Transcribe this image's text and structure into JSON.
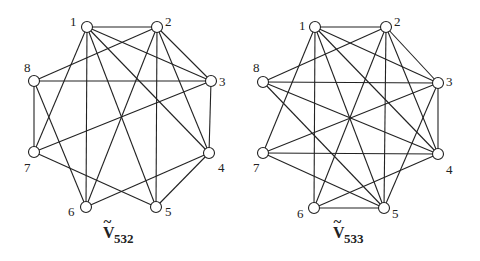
{
  "graphs": [
    {
      "name": "V532",
      "label": {
        "main": "V",
        "accent": "~",
        "subscript": "532",
        "x": 103,
        "y": 238
      },
      "nodes": [
        {
          "id": "1",
          "x": 87,
          "y": 27,
          "lx": 70,
          "ly": 26
        },
        {
          "id": "2",
          "x": 157,
          "y": 27,
          "lx": 165,
          "ly": 26
        },
        {
          "id": "3",
          "x": 211,
          "y": 81,
          "lx": 219,
          "ly": 86
        },
        {
          "id": "4",
          "x": 209,
          "y": 153,
          "lx": 218,
          "ly": 172
        },
        {
          "id": "5",
          "x": 156,
          "y": 207,
          "lx": 165,
          "ly": 216
        },
        {
          "id": "6",
          "x": 86,
          "y": 207,
          "lx": 68,
          "ly": 216
        },
        {
          "id": "7",
          "x": 34,
          "y": 152,
          "lx": 24,
          "ly": 172
        },
        {
          "id": "8",
          "x": 34,
          "y": 81,
          "lx": 24,
          "ly": 72
        }
      ],
      "edges": [
        [
          "1",
          "2"
        ],
        [
          "1",
          "3"
        ],
        [
          "1",
          "4"
        ],
        [
          "1",
          "5"
        ],
        [
          "1",
          "6"
        ],
        [
          "1",
          "7"
        ],
        [
          "2",
          "3"
        ],
        [
          "2",
          "4"
        ],
        [
          "2",
          "5"
        ],
        [
          "2",
          "6"
        ],
        [
          "2",
          "8"
        ],
        [
          "3",
          "4"
        ],
        [
          "3",
          "7"
        ],
        [
          "3",
          "8"
        ],
        [
          "4",
          "5"
        ],
        [
          "4",
          "6"
        ],
        [
          "5",
          "7"
        ],
        [
          "6",
          "8"
        ],
        [
          "7",
          "8"
        ]
      ]
    },
    {
      "name": "V533",
      "label": {
        "main": "V",
        "accent": "~",
        "subscript": "533",
        "x": 333,
        "y": 238
      },
      "nodes": [
        {
          "id": "1",
          "x": 315,
          "y": 27,
          "lx": 299,
          "ly": 30
        },
        {
          "id": "2",
          "x": 386,
          "y": 27,
          "lx": 394,
          "ly": 26
        },
        {
          "id": "3",
          "x": 438,
          "y": 83,
          "lx": 446,
          "ly": 86
        },
        {
          "id": "4",
          "x": 438,
          "y": 154,
          "lx": 446,
          "ly": 174
        },
        {
          "id": "5",
          "x": 384,
          "y": 208,
          "lx": 392,
          "ly": 218
        },
        {
          "id": "6",
          "x": 314,
          "y": 208,
          "lx": 297,
          "ly": 218
        },
        {
          "id": "7",
          "x": 263,
          "y": 153,
          "lx": 253,
          "ly": 172
        },
        {
          "id": "8",
          "x": 263,
          "y": 82,
          "lx": 253,
          "ly": 72
        }
      ],
      "edges": [
        [
          "1",
          "2"
        ],
        [
          "1",
          "3"
        ],
        [
          "1",
          "4"
        ],
        [
          "1",
          "5"
        ],
        [
          "1",
          "6"
        ],
        [
          "1",
          "7"
        ],
        [
          "2",
          "3"
        ],
        [
          "2",
          "4"
        ],
        [
          "2",
          "5"
        ],
        [
          "2",
          "6"
        ],
        [
          "2",
          "8"
        ],
        [
          "3",
          "4"
        ],
        [
          "3",
          "5"
        ],
        [
          "3",
          "7"
        ],
        [
          "3",
          "8"
        ],
        [
          "4",
          "6"
        ],
        [
          "4",
          "7"
        ],
        [
          "4",
          "8"
        ],
        [
          "5",
          "6"
        ],
        [
          "5",
          "7"
        ],
        [
          "5",
          "8"
        ]
      ]
    }
  ],
  "style": {
    "stroke": "#222222",
    "node_fill": "#ffffff",
    "node_radius": 5.5
  }
}
